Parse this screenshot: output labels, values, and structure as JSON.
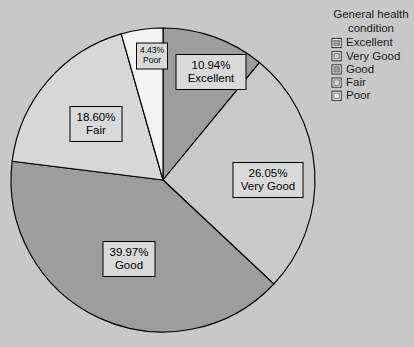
{
  "background_color": "#c8c8c8",
  "legend": {
    "title_line1": "General health",
    "title_line2": "condition",
    "items": [
      {
        "label": "Excellent",
        "color": "#9d9d9d"
      },
      {
        "label": "Very Good",
        "color": "#c9c9c9"
      },
      {
        "label": "Good",
        "color": "#9d9d9d"
      },
      {
        "label": "Fair",
        "color": "#d7d7d7"
      },
      {
        "label": "Poor",
        "color": "#f4f4f4"
      }
    ]
  },
  "chart_data": {
    "type": "pie",
    "xlabel": "",
    "ylabel": "",
    "legend_position": "right",
    "grid": false,
    "start_angle_deg": 0,
    "direction": "clockwise",
    "categories": [
      "Excellent",
      "Very Good",
      "Good",
      "Fair",
      "Poor"
    ],
    "values": [
      10.94,
      26.05,
      39.97,
      18.6,
      4.43
    ],
    "value_unit": "%",
    "colors": [
      "#9d9d9d",
      "#c9c9c9",
      "#9d9d9d",
      "#d7d7d7",
      "#f4f4f4"
    ],
    "labels": [
      {
        "category": "Excellent",
        "percent": "10.94%",
        "name": "Excellent",
        "box_x": 211,
        "box_y": 72
      },
      {
        "category": "Very Good",
        "percent": "26.05%",
        "name": "Very Good",
        "box_x": 268,
        "box_y": 180
      },
      {
        "category": "Good",
        "percent": "39.97%",
        "name": "Good",
        "box_x": 129,
        "box_y": 259
      },
      {
        "category": "Fair",
        "percent": "18.60%",
        "name": "Fair",
        "box_x": 96,
        "box_y": 124
      },
      {
        "category": "Poor",
        "percent": "4.43%",
        "name": "Poor",
        "box_x": 152,
        "box_y": 56
      }
    ]
  }
}
